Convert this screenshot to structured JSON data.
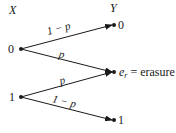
{
  "inputs": {
    "header": "X",
    "nodes": [
      "0",
      "1"
    ]
  },
  "outputs": {
    "header": "Y",
    "nodes": [
      "0",
      "e_r",
      "1"
    ],
    "erasure_label": "= erasure",
    "erasure_symbol": "e",
    "erasure_sub": "r"
  },
  "edges": [
    {
      "from": "0",
      "to": "0",
      "label": "1 − p"
    },
    {
      "from": "0",
      "to": "e_r",
      "label": "p"
    },
    {
      "from": "1",
      "to": "e_r",
      "label": "p"
    },
    {
      "from": "1",
      "to": "1",
      "label": "1 − p"
    }
  ],
  "colors": {
    "ink": "#1a1a1a",
    "background": "#ffffff"
  }
}
